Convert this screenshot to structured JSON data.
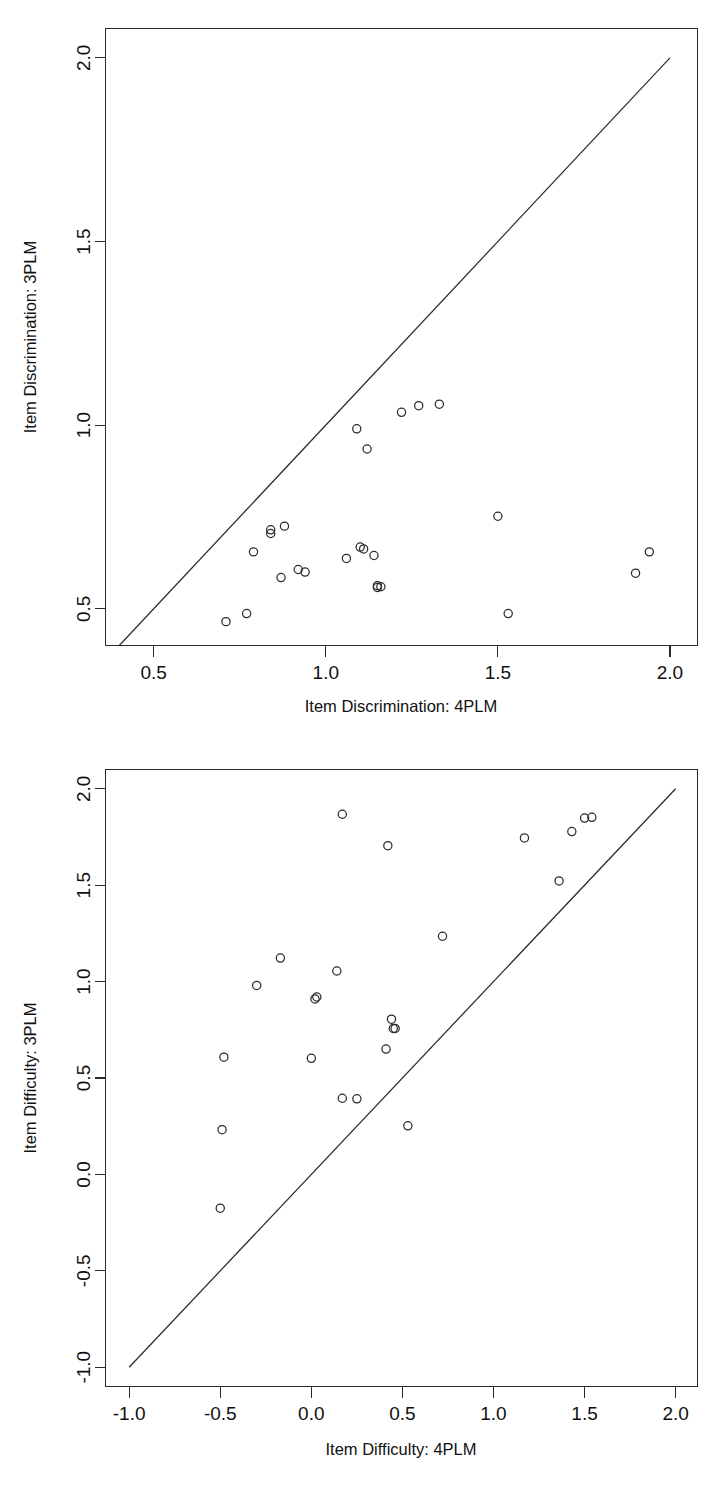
{
  "figure": {
    "panel_count": 2,
    "background_color": "#ffffff",
    "foreground_color": "#2b2b2b"
  },
  "chart_data": [
    {
      "id": "item-discrimination",
      "type": "scatter",
      "title": "",
      "xlabel": "Item Discrimination: 4PLM",
      "ylabel": "Item Discrimination: 3PLM",
      "xlim": [
        0.36,
        2.08
      ],
      "ylim": [
        0.4,
        2.08
      ],
      "xticks": [
        0.5,
        1.0,
        1.5,
        2.0
      ],
      "yticks": [
        0.5,
        1.0,
        1.5,
        2.0
      ],
      "xtick_labels": [
        "0.5",
        "1.0",
        "1.5",
        "2.0"
      ],
      "ytick_labels": [
        "0.5",
        "1.0",
        "1.5",
        "2.0"
      ],
      "grid": false,
      "legend": null,
      "reference_line": {
        "kind": "identity",
        "x": [
          0.4,
          2.0
        ],
        "y": [
          0.4,
          2.0
        ]
      },
      "x": [
        0.71,
        0.77,
        0.79,
        0.84,
        0.84,
        0.87,
        0.88,
        0.92,
        0.94,
        1.06,
        1.09,
        1.1,
        1.11,
        1.12,
        1.14,
        1.15,
        1.15,
        1.16,
        1.22,
        1.27,
        1.33,
        1.5,
        1.53,
        1.9,
        1.94
      ],
      "y": [
        0.465,
        0.487,
        0.655,
        0.705,
        0.715,
        0.585,
        0.725,
        0.607,
        0.6,
        0.637,
        0.99,
        0.668,
        0.663,
        0.935,
        0.645,
        0.558,
        0.563,
        0.56,
        1.035,
        1.053,
        1.057,
        0.752,
        0.487,
        0.597,
        0.655
      ]
    },
    {
      "id": "item-difficulty",
      "type": "scatter",
      "title": "",
      "xlabel": "Item Difficulty: 4PLM",
      "ylabel": "Item Difficulty: 3PLM",
      "xlim": [
        -1.13,
        2.12
      ],
      "ylim": [
        -1.1,
        2.1
      ],
      "xticks": [
        -1.0,
        -0.5,
        0.0,
        0.5,
        1.0,
        1.5,
        2.0
      ],
      "yticks": [
        -1.0,
        -0.5,
        0.0,
        0.5,
        1.0,
        1.5,
        2.0
      ],
      "xtick_labels": [
        "-1.0",
        "-0.5",
        "0.0",
        "0.5",
        "1.0",
        "1.5",
        "2.0"
      ],
      "ytick_labels": [
        "-1.0",
        "-0.5",
        "0.0",
        "0.5",
        "1.0",
        "1.5",
        "2.0"
      ],
      "grid": false,
      "legend": null,
      "reference_line": {
        "kind": "identity",
        "x": [
          -1.0,
          2.0
        ],
        "y": [
          -1.0,
          2.0
        ]
      },
      "x": [
        -0.5,
        -0.49,
        -0.48,
        -0.3,
        -0.17,
        0.0,
        0.02,
        0.03,
        0.14,
        0.17,
        0.17,
        0.25,
        0.41,
        0.42,
        0.44,
        0.45,
        0.46,
        0.53,
        0.72,
        1.17,
        1.36,
        1.43,
        1.5,
        1.54
      ],
      "y": [
        -0.175,
        0.232,
        0.608,
        0.98,
        1.122,
        0.602,
        0.91,
        0.92,
        1.055,
        1.868,
        0.395,
        0.392,
        0.65,
        1.705,
        0.805,
        0.757,
        0.757,
        0.252,
        1.235,
        1.745,
        1.522,
        1.778,
        1.848,
        1.852
      ]
    }
  ],
  "panels": [
    {
      "name": "discrimination-panel",
      "x_axis_title": "Item Discrimination: 4PLM",
      "y_axis_title": "Item Discrimination: 3PLM"
    },
    {
      "name": "difficulty-panel",
      "x_axis_title": "Item Difficulty: 4PLM",
      "y_axis_title": "Item Difficulty: 3PLM"
    }
  ]
}
